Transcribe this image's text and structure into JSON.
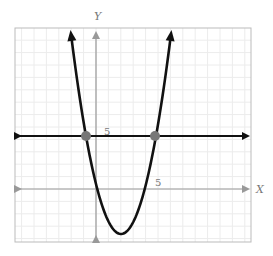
{
  "chart_data": {
    "type": "line",
    "title": "",
    "xlabel": "X",
    "ylabel": "Y",
    "tick_labels": {
      "x": "5",
      "y": "5"
    },
    "grid": true,
    "xlim": [
      -6.5,
      12.5
    ],
    "ylim": [
      -4.3,
      12.8
    ],
    "series": [
      {
        "name": "parabola",
        "description": "upward-opening parabola with arrows at both ends",
        "vertex": [
          2.1,
          -3.6
        ],
        "x_intercepts": [
          0.25,
          3.9
        ],
        "points": [
          [
            -2.1,
            12.8
          ],
          [
            -0.8,
            4.3
          ],
          [
            0.25,
            0
          ],
          [
            2.1,
            -3.6
          ],
          [
            3.9,
            0
          ],
          [
            4.8,
            4.3
          ],
          [
            6.1,
            12.8
          ]
        ]
      },
      {
        "name": "horizontal line",
        "description": "horizontal line with arrows at both ends",
        "y": 4.3
      }
    ],
    "marked_points": [
      [
        -0.8,
        4.3
      ],
      [
        4.8,
        4.3
      ]
    ],
    "colors": {
      "curve": "#111111",
      "line": "#111111",
      "axes": "#999999",
      "grid": "#e8e8e8",
      "frame": "#bbbbbb",
      "points": "#777777"
    }
  }
}
